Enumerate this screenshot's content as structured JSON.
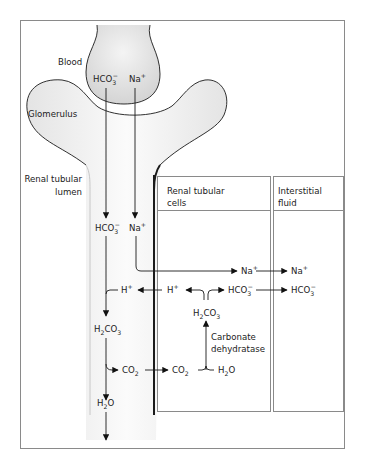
{
  "figure": {
    "type": "renal bicarbonate reabsorption diagram",
    "regions": {
      "blood": "Blood",
      "glomerulus": "Glomerulus",
      "lumen_line1": "Renal tubular",
      "lumen_line2": "lumen",
      "cells_line1": "Renal tubular",
      "cells_line2": "cells",
      "interstitial_line1": "Interstitial",
      "interstitial_line2": "fluid"
    },
    "species": {
      "bicarbonate_base": "HCO",
      "bicarbonate_sub": "3",
      "bicarbonate_sup": "−",
      "sodium_base": "Na",
      "sodium_sup": "+",
      "hydrogen_base": "H",
      "hydrogen_sup": "+",
      "carbonic_acid_h": "H",
      "carbonic_acid_h_sub": "2",
      "carbonic_acid_co": "CO",
      "carbonic_acid_co_sub": "3",
      "co2_base": "CO",
      "co2_sub": "2",
      "water_h": "H",
      "water_sub": "2",
      "water_o": "O"
    },
    "enzyme": {
      "line1": "Carbonate",
      "line2": "dehydratase"
    },
    "colors": {
      "line": "#1a1a1a",
      "frame": "#888888",
      "shade": "#dcdcdc",
      "text": "#222222"
    }
  }
}
